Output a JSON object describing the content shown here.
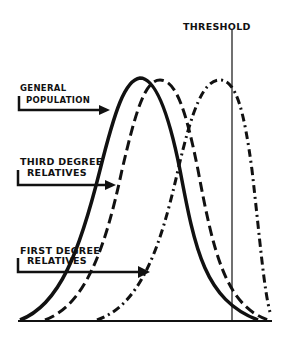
{
  "diagram": {
    "threshold_label": "THRESHOLD",
    "labels": {
      "general_line1": "GENERAL",
      "general_line2": "POPULATION",
      "third_line1": "THIRD DEGREE",
      "third_line2": "RELATIVES",
      "first_line1": "FIRST DEGREE",
      "first_line2": "RELATIVES"
    },
    "series": [
      {
        "name": "General population",
        "style": "solid",
        "peak_x": 140
      },
      {
        "name": "Third degree relatives",
        "style": "dashed",
        "peak_x": 160
      },
      {
        "name": "First degree relatives",
        "style": "dash-dot",
        "peak_x": 220
      }
    ],
    "ink_color": "#111111"
  }
}
